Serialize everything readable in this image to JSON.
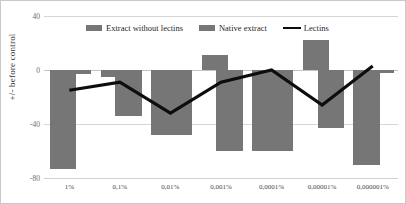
{
  "chart_data": {
    "type": "bar",
    "title": "",
    "subtitle": "",
    "xlabel": "",
    "ylabel": "+/- before control",
    "ylim": [
      -80,
      40
    ],
    "yticks": [
      40,
      0,
      -40,
      -80
    ],
    "ytick_labels": [
      "40",
      "0",
      "-40",
      "-80"
    ],
    "grid": true,
    "legend_position": "top-center",
    "categories": [
      "1%",
      "0,1%",
      "0,01%",
      "0,001%",
      "0,0001%",
      "0,00001%",
      "0,000001%"
    ],
    "series": [
      {
        "name": "Extract without lectins",
        "type": "bar",
        "color": "#767676",
        "values": [
          -73,
          -5,
          -48,
          11,
          -60,
          22,
          -70
        ]
      },
      {
        "name": "Native extract",
        "type": "bar",
        "color": "#767676",
        "values": [
          -3,
          -34,
          -48,
          -60,
          -60,
          -43,
          -2
        ]
      },
      {
        "name": "Lectins",
        "type": "line",
        "color": "#0d0d0d",
        "values": [
          -15,
          -9,
          -32,
          -9,
          0,
          -26,
          3
        ]
      }
    ]
  },
  "legend": {
    "items": [
      {
        "label": "Extract without lectins",
        "marker": "bar-swatch"
      },
      {
        "label": "Native extract",
        "marker": "bar-swatch"
      },
      {
        "label": "Lectins",
        "marker": "line-swatch"
      }
    ]
  },
  "axes": {
    "y_label": "+/- before control",
    "y_tick_0": "40",
    "y_tick_1": "0",
    "y_tick_2": "-40",
    "y_tick_3": "-80",
    "x_tick_0": "1%",
    "x_tick_1": "0,1%",
    "x_tick_2": "0,01%",
    "x_tick_3": "0,001%",
    "x_tick_4": "0,0001%",
    "x_tick_5": "0,00001%",
    "x_tick_6": "0,000001%"
  }
}
